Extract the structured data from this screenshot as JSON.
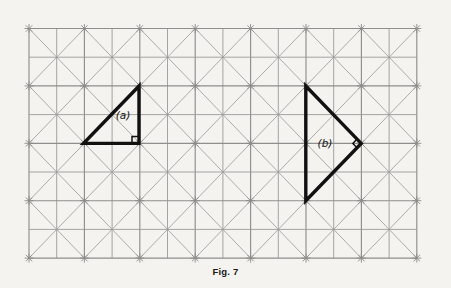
{
  "figure": {
    "caption": "Fig. 7",
    "caption_x": 225,
    "caption_y": 266,
    "background_color": "#f5f3ef",
    "ink_color": "#111111",
    "grid_color": "#9a9a98"
  },
  "grid": {
    "origin_x": 29,
    "origin_y": 28.5,
    "major_cell_width": 55.4,
    "major_cell_height": 57.4,
    "major_cols": 7,
    "major_rows": 4,
    "minor_subdivisions": 2,
    "diagonals": "both",
    "node_marker": "star-overshoot",
    "node_overshoot": 4.5,
    "left": 29,
    "right": 416.8,
    "top": 28.5,
    "bottom": 258.1
  },
  "shapes": [
    {
      "id": "triangle-a",
      "label": "(a)",
      "label_x": 123,
      "label_y": 119,
      "kind": "right-triangle",
      "points": [
        {
          "x": 139.0,
          "y": 86.0
        },
        {
          "x": 83.6,
          "y": 143.4
        },
        {
          "x": 139.0,
          "y": 143.4
        }
      ],
      "right_angle_vertex_index": 2,
      "right_angle_marker": "square",
      "right_angle_marker_size": 7
    },
    {
      "id": "triangle-b",
      "label": "(b)",
      "label_x": 325,
      "label_y": 147,
      "kind": "right-triangle",
      "points": [
        {
          "x": 305.8,
          "y": 86.0
        },
        {
          "x": 361.2,
          "y": 143.4
        },
        {
          "x": 305.8,
          "y": 200.8
        }
      ],
      "right_angle_vertex_index": 1,
      "right_angle_marker": "diamond",
      "right_angle_marker_size": 6
    }
  ]
}
